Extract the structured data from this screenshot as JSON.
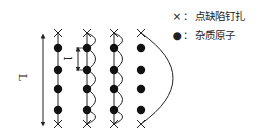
{
  "diagram": {
    "length_label": "L",
    "spacing_label": "l",
    "columns": [
      {
        "id": "straight",
        "x": 58,
        "shape": "straight"
      },
      {
        "id": "small-bows-1",
        "x": 87,
        "shape": "bows"
      },
      {
        "id": "small-bows-2",
        "x": 114,
        "shape": "bows"
      },
      {
        "id": "large-bow",
        "x": 141,
        "shape": "arc"
      }
    ],
    "pin_y": [
      33,
      124
    ],
    "impurity_y": [
      48,
      70,
      89,
      110
    ],
    "colors": {
      "line": "#222222",
      "dot": "#111111"
    }
  },
  "legend": {
    "items": [
      {
        "symbol": "×",
        "icon": "cross-icon",
        "separator": "：",
        "label": "点缺陷钉扎"
      },
      {
        "symbol": "●",
        "icon": "dot-icon",
        "separator": "：",
        "label": "杂质原子"
      }
    ]
  }
}
